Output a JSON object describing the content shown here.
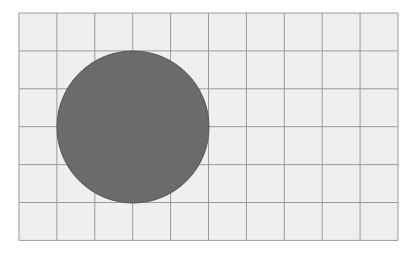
{
  "board": {
    "left": 19,
    "top": 13,
    "cols": 10,
    "rows": 6,
    "cell": 37.9,
    "background": "#efefef",
    "line_color": "#9a9a9a"
  },
  "circle": {
    "cx": 133,
    "cy": 127,
    "r": 76,
    "fill": "#6b6b6b",
    "stroke": "#555555"
  }
}
